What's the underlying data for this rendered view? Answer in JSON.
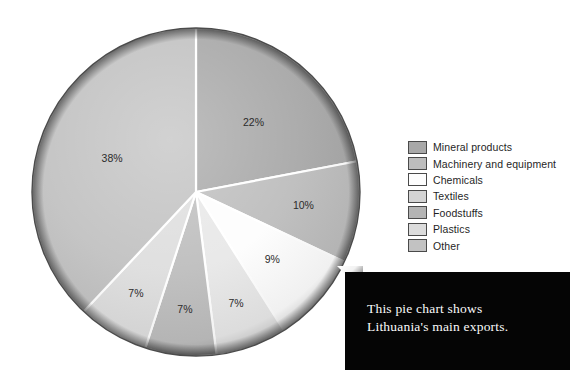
{
  "chart_data": {
    "type": "pie",
    "title": "",
    "categories": [
      "Mineral products",
      "Machinery and equipment",
      "Chemicals",
      "Textiles",
      "Foodstuffs",
      "Plastics",
      "Other"
    ],
    "values": [
      22,
      10,
      9,
      7,
      7,
      7,
      38
    ],
    "labels": [
      "22%",
      "10%",
      "9%",
      "7%",
      "7%",
      "7%",
      "38%"
    ],
    "unit": "%",
    "legend_position": "right",
    "grid": false,
    "start_angle_deg": 0,
    "direction": "clockwise",
    "colors": [
      "#a8a8a8",
      "#bdbdbd",
      "#fdfdfd",
      "#e8e8e8",
      "#bebebe",
      "#dedede",
      "#c2c2c2"
    ],
    "slices": [
      {
        "label": "Mineral products",
        "value": 22,
        "display": "22%",
        "color": "#a8a8a8"
      },
      {
        "label": "Machinery and equipment",
        "value": 10,
        "display": "10%",
        "color": "#bdbdbd"
      },
      {
        "label": "Chemicals",
        "value": 9,
        "display": "9%",
        "color": "#fdfdfd"
      },
      {
        "label": "Textiles",
        "value": 7,
        "display": "7%",
        "color": "#e8e8e8"
      },
      {
        "label": "Foodstuffs",
        "value": 7,
        "display": "7%",
        "color": "#bebebe"
      },
      {
        "label": "Plastics",
        "value": 7,
        "display": "7%",
        "color": "#dedede"
      },
      {
        "label": "Other",
        "value": 38,
        "display": "38%",
        "color": "#c2c2c2"
      }
    ]
  },
  "legend": {
    "items": [
      {
        "label": "Mineral products",
        "color": "#a8a8a8"
      },
      {
        "label": "Machinery and equipment",
        "color": "#bdbdbd"
      },
      {
        "label": "Chemicals",
        "color": "#fdfdfd"
      },
      {
        "label": "Textiles",
        "color": "#d4d4d4"
      },
      {
        "label": "Foodstuffs",
        "color": "#b4b4b4"
      },
      {
        "label": "Plastics",
        "color": "#dcdcdc"
      },
      {
        "label": "Other",
        "color": "#c2c2c2"
      }
    ]
  },
  "caption": {
    "line1": "This pie chart shows",
    "line2": "Lithuania's main exports.",
    "background": "#050505",
    "text_color": "#fafafa"
  }
}
